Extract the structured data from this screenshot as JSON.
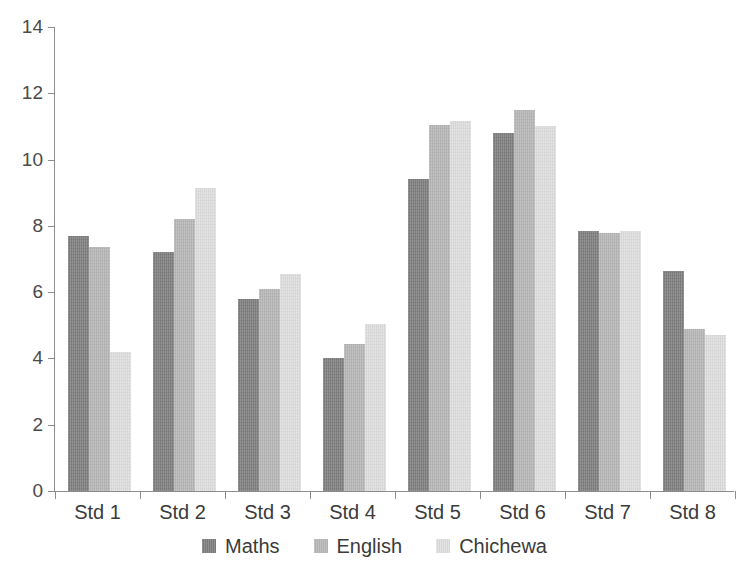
{
  "chart_data": {
    "type": "bar",
    "title": "",
    "subtitle": "",
    "xlabel": "",
    "ylabel": "",
    "categories": [
      "Std 1",
      "Std 2",
      "Std 3",
      "Std 4",
      "Std 5",
      "Std 6",
      "Std 7",
      "Std 8"
    ],
    "series": [
      {
        "name": "Maths",
        "color": "#7d7d7d",
        "values": [
          7.7,
          7.2,
          5.8,
          4.0,
          9.4,
          10.8,
          7.85,
          6.65
        ]
      },
      {
        "name": "English",
        "color": "#b6b6b6",
        "values": [
          7.35,
          8.2,
          6.1,
          4.45,
          11.05,
          11.5,
          7.8,
          4.9
        ]
      },
      {
        "name": "Chichewa",
        "color": "#dedede",
        "values": [
          4.2,
          9.15,
          6.55,
          5.05,
          11.15,
          11.0,
          7.85,
          4.7
        ]
      }
    ],
    "ylim": [
      0,
      14
    ],
    "yticks": [
      0,
      2,
      4,
      6,
      8,
      10,
      12,
      14
    ],
    "ytick_labels": [
      "0",
      "2",
      "4",
      "6",
      "8",
      "10",
      "12",
      "14"
    ],
    "grid": false,
    "legend_position": "bottom-center",
    "legend_entries": [
      "Maths",
      "English",
      "Chichewa"
    ],
    "background_color": "#ffffff",
    "axis_color": "#8d8d8d"
  }
}
